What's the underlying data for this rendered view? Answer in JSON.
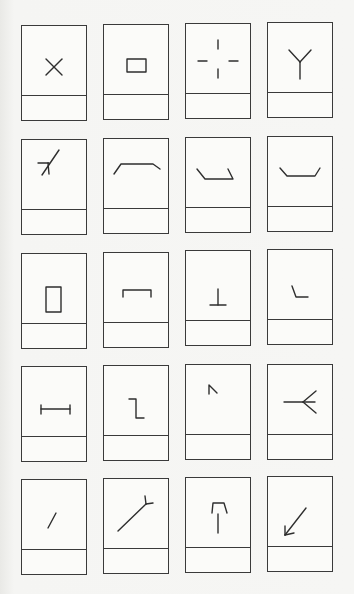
{
  "sheet": {
    "rows": 5,
    "columns": 4,
    "line_color": "#3a3a3a",
    "background": "#f4f4f2"
  },
  "cards": [
    {
      "row": 1,
      "col": 1,
      "symbol": "x-cross-icon",
      "label": ""
    },
    {
      "row": 1,
      "col": 2,
      "symbol": "small-rectangle-icon",
      "label": ""
    },
    {
      "row": 1,
      "col": 3,
      "symbol": "broken-crosshair-icon",
      "label": ""
    },
    {
      "row": 1,
      "col": 4,
      "symbol": "y-fork-icon",
      "label": ""
    },
    {
      "row": 2,
      "col": 1,
      "symbol": "diagonal-with-tick-icon",
      "label": ""
    },
    {
      "row": 2,
      "col": 2,
      "symbol": "trapezoid-cap-icon",
      "label": ""
    },
    {
      "row": 2,
      "col": 3,
      "symbol": "tray-slanted-left-icon",
      "label": ""
    },
    {
      "row": 2,
      "col": 4,
      "symbol": "tray-open-icon",
      "label": ""
    },
    {
      "row": 3,
      "col": 1,
      "symbol": "tall-rectangle-icon",
      "label": ""
    },
    {
      "row": 3,
      "col": 2,
      "symbol": "bracket-down-icon",
      "label": ""
    },
    {
      "row": 3,
      "col": 3,
      "symbol": "inverted-t-icon",
      "label": ""
    },
    {
      "row": 3,
      "col": 4,
      "symbol": "slanted-corner-icon",
      "label": ""
    },
    {
      "row": 4,
      "col": 1,
      "symbol": "i-beam-horizontal-icon",
      "label": ""
    },
    {
      "row": 4,
      "col": 2,
      "symbol": "step-z-icon",
      "label": ""
    },
    {
      "row": 4,
      "col": 3,
      "symbol": "caret-small-icon",
      "label": ""
    },
    {
      "row": 4,
      "col": 4,
      "symbol": "arrow-fork-left-icon",
      "label": ""
    },
    {
      "row": 5,
      "col": 1,
      "symbol": "short-diagonal-icon",
      "label": ""
    },
    {
      "row": 5,
      "col": 2,
      "symbol": "long-diagonal-fork-icon",
      "label": ""
    },
    {
      "row": 5,
      "col": 3,
      "symbol": "arch-over-line-icon",
      "label": ""
    },
    {
      "row": 5,
      "col": 4,
      "symbol": "arrow-down-left-icon",
      "label": ""
    }
  ]
}
